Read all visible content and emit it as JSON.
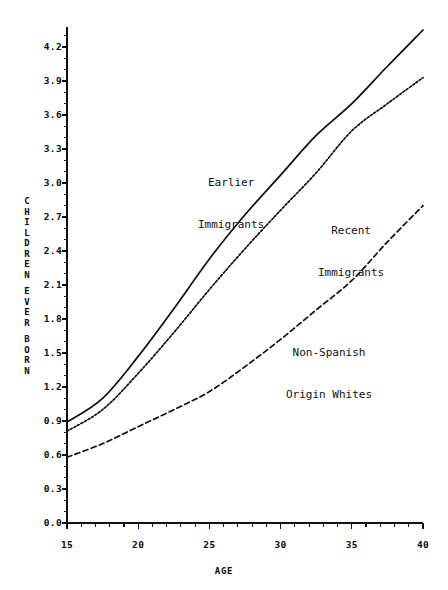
{
  "chart_data": {
    "type": "line",
    "title": "",
    "xlabel": "AGE",
    "ylabel": "CHILDREN EVER BORN",
    "xlim": [
      15,
      40
    ],
    "ylim": [
      0.0,
      4.35
    ],
    "grid": false,
    "legend_position": "inline-annotations",
    "x_ticks": [
      "15",
      "20",
      "25",
      "30",
      "35",
      "40"
    ],
    "x_tick_values": [
      15,
      20,
      25,
      30,
      35,
      40
    ],
    "y_ticks": [
      "0.0",
      "0.3",
      "0.6",
      "0.9",
      "1.2",
      "1.5",
      "1.8",
      "2.1",
      "2.4",
      "2.7",
      "3.0",
      "3.3",
      "3.6",
      "3.9",
      "4.2"
    ],
    "y_tick_values": [
      0.0,
      0.3,
      0.6,
      0.9,
      1.2,
      1.5,
      1.8,
      2.1,
      2.4,
      2.7,
      3.0,
      3.3,
      3.6,
      3.9,
      4.2
    ],
    "x": [
      15,
      17.5,
      20,
      22.5,
      25,
      27.5,
      30,
      32.5,
      35,
      37.5,
      40
    ],
    "series": [
      {
        "name": "Earlier Immigrants",
        "style": "solid",
        "values": [
          0.89,
          1.1,
          1.47,
          1.89,
          2.33,
          2.72,
          3.07,
          3.42,
          3.7,
          4.03,
          4.35
        ]
      },
      {
        "name": "Recent Immigrants",
        "style": "dotted",
        "values": [
          0.81,
          1.0,
          1.32,
          1.68,
          2.06,
          2.42,
          2.76,
          3.09,
          3.46,
          3.7,
          3.93
        ]
      },
      {
        "name": "Non-Spanish Origin Whites",
        "style": "dashed",
        "values": [
          0.58,
          0.7,
          0.85,
          1.0,
          1.16,
          1.38,
          1.62,
          1.88,
          2.14,
          2.48,
          2.8
        ]
      }
    ],
    "annotations": [
      {
        "id": "earlier",
        "line1": "Earlier",
        "line2": "Immigrants"
      },
      {
        "id": "recent",
        "line1": "Recent",
        "line2": "Immigrants"
      },
      {
        "id": "nonspanish",
        "line1": "Non-Spanish",
        "line2": "Origin Whites"
      }
    ],
    "axis_title_letters": [
      "C",
      "H",
      "I",
      "L",
      "D",
      "R",
      "E",
      "N",
      "",
      "E",
      "V",
      "E",
      "R",
      "",
      "B",
      "O",
      "R",
      "N"
    ]
  },
  "axes": {
    "y_title_lines": [
      "C",
      "H",
      "I",
      "L",
      "D",
      "R",
      "E",
      "N",
      "E",
      "V",
      "E",
      "R",
      "B",
      "O",
      "R",
      "N"
    ],
    "x_title": "AGE"
  },
  "colors": {
    "background": "#ffffff",
    "ink": "#0d0d0d",
    "axis": "#111111"
  }
}
